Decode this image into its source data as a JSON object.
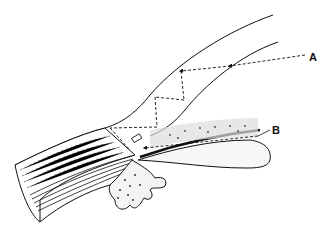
{
  "figure": {
    "type": "anatomical line illustration",
    "background": "#ffffff",
    "ink_color": "#111111",
    "labels": [
      {
        "id": "A",
        "text": "A",
        "description": "light ray path totally internally reflected within cornea (dashed with arrowheads)"
      },
      {
        "id": "B",
        "text": "B",
        "description": "light ray path along the iris surface toward the angle (dashed with arrowheads)"
      }
    ],
    "structures": [
      "cornea",
      "sclera",
      "iris",
      "ciliary body",
      "trabecular meshwork",
      "angle recess"
    ]
  }
}
